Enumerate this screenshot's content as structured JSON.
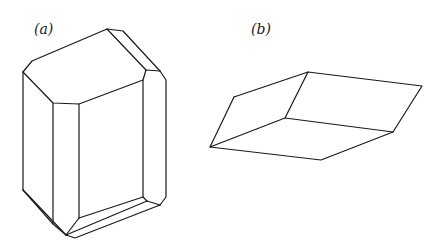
{
  "figure": {
    "panels": [
      {
        "id": "a",
        "label": "(a)",
        "description": "Prismatic crystal with beveled edges and truncated corners"
      },
      {
        "id": "b",
        "label": "(b)",
        "description": "Rhombohedral crystal"
      }
    ]
  },
  "colors": {
    "background": "#ffffff",
    "line": "#1a1a1a"
  }
}
